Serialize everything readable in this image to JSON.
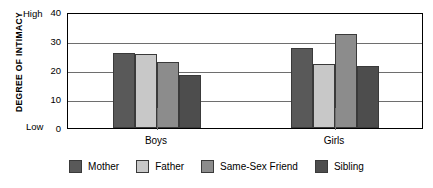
{
  "chart_data": {
    "type": "bar",
    "title": "",
    "subtitle": "",
    "xlabel": "",
    "ylabel": "DEGREE OF INTIMACY",
    "ylim": [
      0,
      40
    ],
    "yticks": [
      0,
      10,
      20,
      30,
      40
    ],
    "ytick_labels": [
      "0",
      "10",
      "20",
      "30",
      "40"
    ],
    "axis_anchor_high": "High",
    "axis_anchor_low": "Low",
    "grid": true,
    "grid_axis": "y",
    "legend_position": "bottom",
    "categories": [
      "Boys",
      "Girls"
    ],
    "series": [
      {
        "name": "Mother",
        "color": "#595959",
        "values": [
          26,
          27.5
        ]
      },
      {
        "name": "Father",
        "color": "#c8c8c8",
        "values": [
          25.5,
          22
        ]
      },
      {
        "name": "Same-Sex Friend",
        "color": "#8c8c8c",
        "values": [
          22.8,
          32.5
        ]
      },
      {
        "name": "Sibling",
        "color": "#4d4d4d",
        "values": [
          18.2,
          21.5
        ]
      }
    ]
  },
  "colors": {
    "axis": "#000000",
    "gridline": "#6e6e6e",
    "bar_outline": "#3a3a3a",
    "background": "#ffffff"
  }
}
